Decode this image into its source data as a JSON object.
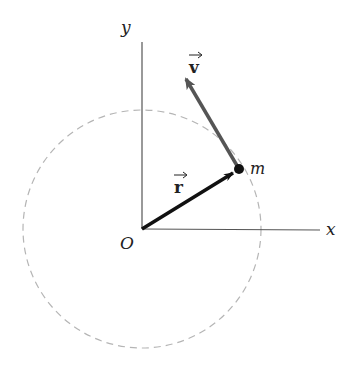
{
  "diagram": {
    "type": "circular-motion-vectors",
    "labels": {
      "y_axis": "y",
      "x_axis": "x",
      "origin": "O",
      "mass": "m",
      "velocity": "v",
      "position": "r"
    },
    "colors": {
      "axis": "#555555",
      "circle": "#b0b0b0",
      "position_vector": "#111111",
      "velocity_vector": "#555555",
      "mass_point": "#111111"
    }
  }
}
